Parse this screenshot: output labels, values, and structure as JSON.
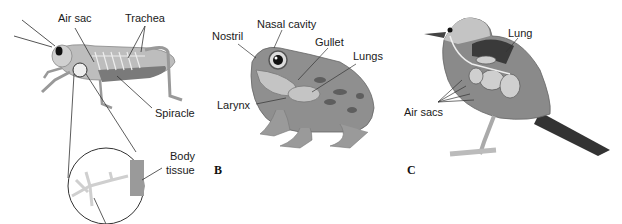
{
  "figure": {
    "panels": [
      {
        "id": "A",
        "letter": "",
        "subject": "grasshopper",
        "labels": {
          "air_sac": "Air sac",
          "trachea": "Trachea",
          "spiracle": "Spiracle",
          "body_tissue_line1": "Body",
          "body_tissue_line2": "tissue"
        }
      },
      {
        "id": "B",
        "letter": "B",
        "subject": "frog",
        "labels": {
          "nostril": "Nostril",
          "nasal_cavity": "Nasal cavity",
          "gullet": "Gullet",
          "lungs": "Lungs",
          "larynx": "Larynx"
        }
      },
      {
        "id": "C",
        "letter": "C",
        "subject": "bird",
        "labels": {
          "lung": "Lung",
          "air_sacs": "Air sacs"
        }
      }
    ],
    "colors": {
      "line": "#333333",
      "body_light": "#c8c8c8",
      "body_mid": "#9a9a9a",
      "body_dark": "#4a4a4a",
      "background": "#ffffff"
    }
  }
}
